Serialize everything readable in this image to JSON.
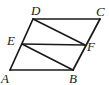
{
  "figure": {
    "kind": "plane-geometry-diagram",
    "shape_name": "parallelogram",
    "background_color": "#ffffff",
    "stroke_color": "#1a1a1a",
    "canvas": {
      "width": 109,
      "height": 85
    },
    "vertices": [
      {
        "id": "A",
        "label": "A",
        "x": 10,
        "y": 70,
        "label_x": 1,
        "label_y": 83
      },
      {
        "id": "B",
        "label": "B",
        "x": 73,
        "y": 70,
        "label_x": 69,
        "label_y": 83
      },
      {
        "id": "C",
        "label": "C",
        "x": 100,
        "y": 19,
        "label_x": 96,
        "label_y": 16
      },
      {
        "id": "D",
        "label": "D",
        "x": 33,
        "y": 19,
        "label_x": 31,
        "label_y": 15
      },
      {
        "id": "E",
        "label": "E",
        "x": 22,
        "y": 44,
        "label_x": 7,
        "label_y": 45
      },
      {
        "id": "F",
        "label": "F",
        "x": 85,
        "y": 45,
        "label_x": 87,
        "label_y": 51
      }
    ],
    "outline": {
      "name": "parallelogram-ABCD",
      "path": "M 10 70 L 73 70 L 100 19 L 33 19 Z"
    },
    "segments": [
      {
        "id": "AB",
        "from": "A",
        "to": "B",
        "role": "side",
        "path": "M 10 70 L 73 70"
      },
      {
        "id": "BC",
        "from": "B",
        "to": "C",
        "role": "side",
        "path": "M 73 70 L 100 19"
      },
      {
        "id": "CD",
        "from": "C",
        "to": "D",
        "role": "side",
        "path": "M 100 19 L 33 19"
      },
      {
        "id": "DA",
        "from": "D",
        "to": "A",
        "role": "side",
        "path": "M 33 19 L 10 70"
      },
      {
        "id": "EF",
        "from": "E",
        "to": "F",
        "role": "chord",
        "path": "M 22 44 L 85 45"
      },
      {
        "id": "DF",
        "from": "D",
        "to": "F",
        "role": "chord",
        "path": "M 33 19 L 85 45"
      },
      {
        "id": "EB",
        "from": "E",
        "to": "B",
        "role": "chord",
        "path": "M 22 44 L 73 70"
      }
    ],
    "inner_parallelogram": {
      "name": "parallelogram-EBFD",
      "vertex_order": "E, B, F, D"
    }
  }
}
